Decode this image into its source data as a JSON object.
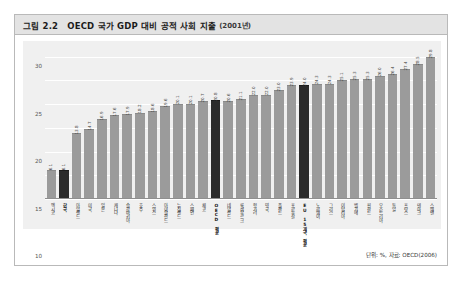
{
  "figure": {
    "number": "그림 2.2",
    "title": "OECD 국가 GDP 대비 공적 사회 지출",
    "year_note": "(2001년)",
    "source_note": "단위: %, 자료: OECD(2006)"
  },
  "chart_data": {
    "type": "bar",
    "title": "OECD 국가 GDP 대비 공적 사회 지출 (2001년)",
    "xlabel": "",
    "ylabel": "",
    "ylim": [
      0,
      32
    ],
    "yticks": [
      0,
      5,
      10,
      15,
      20,
      25,
      30
    ],
    "grid": true,
    "legend": "none",
    "unit": "%",
    "source": "OECD(2006)",
    "bar_color": "#9b9b9b",
    "highlight_color": "#2b2b2b",
    "categories": [
      "멕시코",
      "한국",
      "아일랜드",
      "미국",
      "일본",
      "캐나다",
      "슬로바키아",
      "호주",
      "스위스",
      "아이슬란드",
      "뉴질랜드",
      "스페인",
      "체코",
      "OECD 평균",
      "네덜란드",
      "룩셈부르크",
      "헝가리",
      "영국",
      "폴란드",
      "포르투갈",
      "EU 15개국 평균",
      "노르웨이",
      "그리스",
      "이탈리아",
      "벨기에",
      "핀란드",
      "오스트리아",
      "독일",
      "프랑스",
      "덴마크",
      "스웨덴"
    ],
    "values": [
      6.1,
      6.1,
      13.8,
      14.7,
      16.9,
      17.6,
      17.9,
      18.2,
      18.6,
      19.6,
      20.1,
      20.1,
      20.7,
      20.8,
      20.6,
      21.1,
      22.0,
      22.0,
      23.0,
      23.9,
      24.0,
      24.3,
      24.3,
      25.1,
      25.3,
      25.3,
      26.0,
      26.4,
      27.4,
      28.5,
      29.8
    ],
    "highlighted": [
      "한국",
      "OECD 평균",
      "EU 15개국 평균"
    ],
    "bold_labels": [
      "한국",
      "OECD 평균",
      "EU 15개국 평균"
    ]
  }
}
